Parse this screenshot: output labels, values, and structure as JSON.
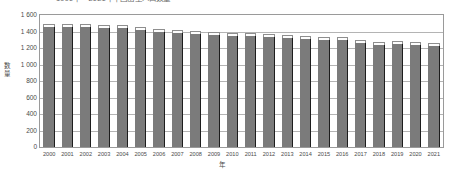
{
  "chart_data": {
    "type": "bar",
    "title": "1990年—2021年中国出生人口数量",
    "xlabel": "年",
    "ylabel": "数量",
    "categories": [
      "2000",
      "2001",
      "2002",
      "2003",
      "2004",
      "2005",
      "2006",
      "2007",
      "2008",
      "2009",
      "2010",
      "2011",
      "2012",
      "2013",
      "2014",
      "2015",
      "2016",
      "2017",
      "2018",
      "2019",
      "2020",
      "2021"
    ],
    "values": [
      1450,
      1455,
      1452,
      1440,
      1437,
      1418,
      1395,
      1378,
      1370,
      1360,
      1348,
      1340,
      1330,
      1322,
      1315,
      1300,
      1295,
      1255,
      1240,
      1245,
      1235,
      1230
    ],
    "ylim": [
      0,
      1600
    ],
    "yticks": [
      "1 600",
      "1 400",
      "1 200",
      "1 000",
      "800",
      "600",
      "400",
      "200",
      "0"
    ],
    "ytick_values": [
      1600,
      1400,
      1200,
      1000,
      800,
      600,
      400,
      200,
      0
    ],
    "grid": true,
    "legend": "none",
    "bar_color": "#7b7b7b",
    "bar_edge_color": "#1d1d1d",
    "bar_top_color": "#fdfdfd",
    "grid_color": "#b4b4b4",
    "frame_color": "#9a9a9a"
  }
}
